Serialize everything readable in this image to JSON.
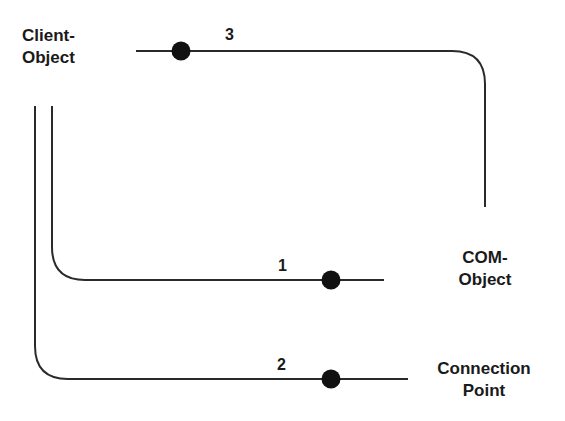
{
  "diagram": {
    "nodes": {
      "client_object": {
        "line1": "Client-",
        "line2": "Object"
      },
      "com_object": {
        "line1": "COM-",
        "line2": "Object"
      },
      "connection_point": {
        "line1": "Connection",
        "line2": "Point"
      }
    },
    "connections": [
      {
        "id": "1",
        "label": "1",
        "from": "Client-Object",
        "to": "COM-Object"
      },
      {
        "id": "2",
        "label": "2",
        "from": "Client-Object",
        "to": "Connection Point"
      },
      {
        "id": "3",
        "label": "3",
        "from": "COM-Object",
        "to": "Client-Object"
      }
    ],
    "colors": {
      "line": "#2a2a2a",
      "dot": "#111111",
      "text": "#1a1a1a",
      "background": "#ffffff"
    }
  }
}
